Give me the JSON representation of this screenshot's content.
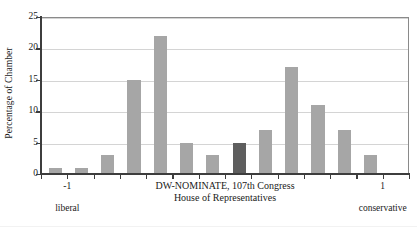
{
  "chart_data": {
    "type": "bar",
    "title": "",
    "subtitle": "",
    "xlabel": "DW-NOMINATE, 107th Congress",
    "xlabel_line2": "House of Representatives",
    "ylabel": "Percentage of Chamber",
    "ylim": [
      0,
      25
    ],
    "yticks": [
      0,
      5,
      10,
      15,
      20,
      25
    ],
    "ytick_labels": [
      "0",
      "5",
      "10",
      "15",
      "20",
      "25"
    ],
    "xlim": [
      -1,
      1
    ],
    "xtick_labels": [
      "-1",
      "1"
    ],
    "xtick_positions": [
      -1,
      1
    ],
    "x_end_labels": [
      "liberal",
      "conservative"
    ],
    "grid": "horizontal",
    "legend": "none",
    "bar_count": 14,
    "categories": [
      "-1.00",
      "-0.85",
      "-0.71",
      "-0.57",
      "-0.43",
      "-0.29",
      "-0.14",
      "0.00",
      "0.14",
      "0.29",
      "0.43",
      "0.57",
      "0.71",
      "0.85"
    ],
    "values": [
      1,
      1,
      3,
      15,
      22,
      5,
      3,
      5,
      7,
      17,
      11,
      7,
      3,
      0
    ],
    "highlight_index": 7,
    "colors": {
      "bar": "#a6a6a6",
      "bar_highlight": "#5e5e5e",
      "gridline": "#d4d4d4",
      "axis": "#3d3d3d",
      "frame": "#8a8a8a",
      "background": "#ffffff",
      "text": "#1a1a1a"
    }
  }
}
